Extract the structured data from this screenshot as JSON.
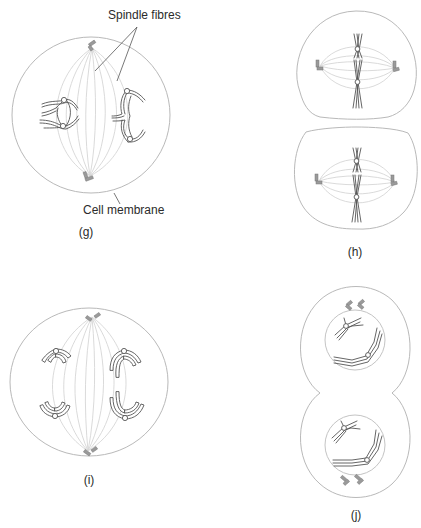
{
  "figure": {
    "colors": {
      "outline": "#b9b9b9",
      "spindle": "#d6d6d6",
      "chromosome": "#555555",
      "centriole": "#9a9a9a",
      "text": "#2b2b2b"
    }
  },
  "labels": {
    "spindle_fibres": "Spindle fibres",
    "cell_membrane": "Cell membrane"
  },
  "panels": [
    {
      "id": "g",
      "label": "(g)",
      "description": "Single cell, paired homologous chromosomes near equator, spindle fibres between two centrioles"
    },
    {
      "id": "h",
      "label": "(h)",
      "description": "Two cells, chromosomes aligned at metaphase plate with spindle fibres"
    },
    {
      "id": "i",
      "label": "(i)",
      "description": "Single cell, chromosomes separating toward poles"
    },
    {
      "id": "j",
      "label": "(j)",
      "description": "Dividing cell with two nuclei reforming, centrioles outside nuclei"
    }
  ]
}
